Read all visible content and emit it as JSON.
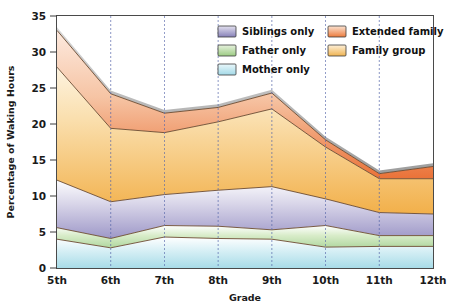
{
  "chart_data": {
    "type": "area",
    "stacked": true,
    "title": "",
    "subtitle": "",
    "xlabel": "Grade",
    "ylabel": "Percentage of Waking Hours",
    "categories": [
      "5th",
      "6th",
      "7th",
      "8th",
      "9th",
      "10th",
      "11th",
      "12th"
    ],
    "x": [
      "5th",
      "6th",
      "7th",
      "8th",
      "9th",
      "10th",
      "11th",
      "12th"
    ],
    "ylim": [
      0,
      35
    ],
    "yticks": [
      0,
      5,
      10,
      15,
      20,
      25,
      30,
      35
    ],
    "ytick_labels": [
      "0",
      "5",
      "10",
      "15",
      "20",
      "25",
      "30",
      "35"
    ],
    "grid": "vertical-dashed",
    "legend_position": "top-right-inside",
    "series": [
      {
        "name": "Mother only",
        "color": "#bfe4ec",
        "values": [
          4.0,
          2.8,
          4.3,
          4.1,
          4.0,
          2.9,
          3.0,
          3.0
        ],
        "cumulative": [
          4.0,
          2.8,
          4.3,
          4.1,
          4.0,
          2.9,
          3.0,
          3.0
        ]
      },
      {
        "name": "Father only",
        "color": "#bcdcae",
        "values": [
          1.6,
          1.3,
          1.6,
          1.7,
          1.3,
          3.0,
          1.5,
          1.5
        ],
        "cumulative": [
          5.6,
          4.1,
          5.9,
          5.8,
          5.3,
          5.9,
          4.5,
          4.5
        ]
      },
      {
        "name": "Siblings only",
        "color": "#a9a4ce",
        "values": [
          6.6,
          5.1,
          4.3,
          5.0,
          6.0,
          3.7,
          3.2,
          3.0
        ],
        "cumulative": [
          12.2,
          9.2,
          10.2,
          10.8,
          11.3,
          9.6,
          7.7,
          7.5
        ]
      },
      {
        "name": "Family group",
        "color": "#f2b44d",
        "values": [
          15.7,
          10.2,
          8.6,
          9.5,
          10.8,
          7.2,
          4.7,
          4.9
        ],
        "cumulative": [
          27.9,
          19.4,
          18.8,
          20.3,
          22.1,
          16.8,
          12.4,
          12.4
        ]
      },
      {
        "name": "Extended family",
        "color": "#e9703a",
        "values": [
          5.1,
          4.8,
          2.7,
          2.0,
          2.2,
          1.0,
          0.7,
          1.7
        ],
        "cumulative": [
          33.0,
          24.2,
          21.5,
          22.3,
          24.3,
          17.8,
          13.1,
          14.1
        ]
      }
    ]
  },
  "legend": {
    "items": [
      {
        "label": "Siblings only",
        "color": "#9a95c6",
        "column": 0,
        "row": 0
      },
      {
        "label": "Father only",
        "color": "#aed496",
        "column": 0,
        "row": 1
      },
      {
        "label": "Mother only",
        "color": "#b7e2ee",
        "column": 0,
        "row": 2
      },
      {
        "label": "Extended family",
        "color": "#ee8b4d",
        "column": 1,
        "row": 0
      },
      {
        "label": "Family group",
        "color": "#f0bb5e",
        "column": 1,
        "row": 1
      }
    ]
  },
  "axes": {
    "y_title": "Percentage of Waking Hours",
    "x_title": "Grade",
    "y_labels": [
      "35",
      "30",
      "25",
      "20",
      "15",
      "10",
      "5",
      "0"
    ],
    "x_labels": [
      "5th",
      "6th",
      "7th",
      "8th",
      "9th",
      "10th",
      "11th",
      "12th"
    ]
  },
  "colors": {
    "mother_only": "#bfe4ec",
    "father_only": "#bcdcae",
    "siblings_only": "#a9a4ce",
    "family_group": "#f2b44d",
    "extended_family": "#e9703a",
    "frame": "#4a4a4a",
    "gridline": "#5566aa",
    "text": "#1a1a1a",
    "background": "#ffffff"
  }
}
